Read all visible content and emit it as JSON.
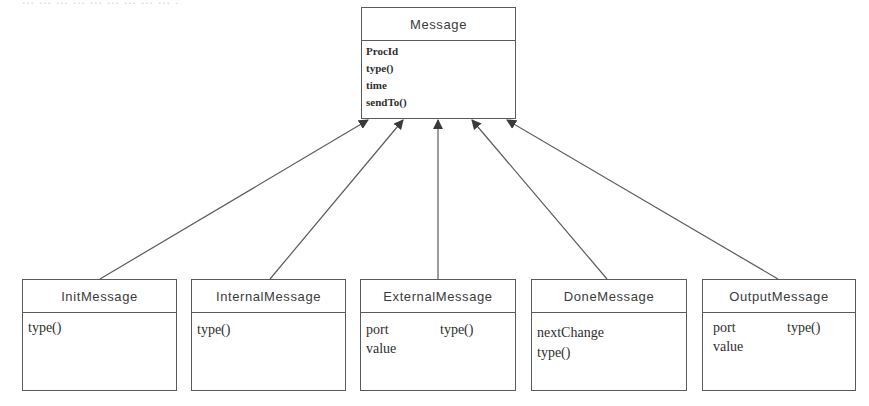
{
  "diagram": {
    "type": "uml-class-inheritance",
    "top_fragment": "... ... ... ... ... ... ... ... ... ,",
    "line_color": "#5a5a5a",
    "parent": {
      "name": "Message",
      "members": [
        "ProcId",
        "type()",
        "time",
        "sendTo()"
      ]
    },
    "children": [
      {
        "name": "InitMessage",
        "members": [
          "type()"
        ]
      },
      {
        "name": "InternalMessage",
        "members": [
          "type()"
        ]
      },
      {
        "name": "ExternalMessage",
        "members": [
          "port",
          "type()",
          "value"
        ]
      },
      {
        "name": "DoneMessage",
        "members": [
          "nextChange",
          "type()"
        ]
      },
      {
        "name": "OutputMessage",
        "members": [
          "port",
          "type()",
          "value"
        ]
      }
    ],
    "relationships": [
      {
        "from": "InitMessage",
        "to": "Message",
        "kind": "generalization"
      },
      {
        "from": "InternalMessage",
        "to": "Message",
        "kind": "generalization"
      },
      {
        "from": "ExternalMessage",
        "to": "Message",
        "kind": "generalization"
      },
      {
        "from": "DoneMessage",
        "to": "Message",
        "kind": "generalization"
      },
      {
        "from": "OutputMessage",
        "to": "Message",
        "kind": "generalization"
      }
    ]
  }
}
